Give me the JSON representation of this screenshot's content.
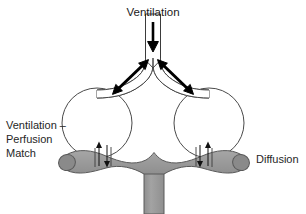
{
  "figure": {
    "title": "Ventilation",
    "background_color": "#ffffff",
    "outline_color": "#4a4a4a",
    "capillary_fill_color": "#9a9a9a",
    "capillary_end_color": "#8a8a8a",
    "arrow_color": "#000000"
  },
  "labels": {
    "top": "Ventilation",
    "left_line1": "Ventilation –",
    "left_line2": "Perfusion",
    "left_line3": "Match",
    "right": "Diffusion"
  },
  "parts": {
    "trachea": "trachea",
    "bronchus_left": "left-bronchus",
    "bronchus_right": "right-bronchus",
    "alveolus_left": "left-alveolus",
    "alveolus_right": "right-alveolus",
    "capillary_bed": "capillary-bed",
    "vessel_stem": "vessel-stem"
  },
  "arrows": {
    "inflow": "downward-airflow-arrow",
    "bifurcation_left": "left-bidirectional-airflow-arrow",
    "bifurcation_right": "right-bidirectional-airflow-arrow",
    "gas_exchange_up": "gas-exchange-up-arrow",
    "gas_exchange_down": "gas-exchange-down-arrow"
  }
}
